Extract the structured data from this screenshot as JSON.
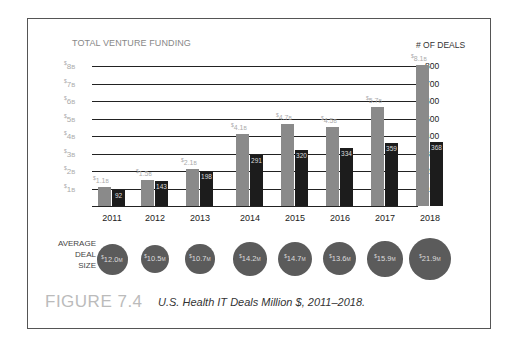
{
  "chart_data": {
    "type": "bar",
    "title": "U.S. Health IT Deals Million $, 2011–2018.",
    "figure_label": "FIGURE 7.4",
    "left_axis_title": "TOTAL VENTURE FUNDING",
    "right_axis_title": "# OF DEALS",
    "categories": [
      "2011",
      "2012",
      "2013",
      "2014",
      "2015",
      "2016",
      "2017",
      "2018"
    ],
    "series": [
      {
        "name": "Total Venture Funding ($B)",
        "axis": "left",
        "values": [
          1.1,
          1.5,
          2.1,
          4.1,
          4.7,
          4.5,
          5.7,
          8.1
        ],
        "labels": [
          "$1.1B",
          "$1.5B",
          "$2.1B",
          "$4.1B",
          "$4.7B",
          "$4.5B",
          "$5.7B",
          "$8.1B"
        ],
        "color": "#8a8a8a"
      },
      {
        "name": "# of Deals",
        "axis": "right",
        "values": [
          92,
          143,
          198,
          291,
          320,
          334,
          359,
          368
        ],
        "color": "#1c1c1c"
      },
      {
        "name": "Average Deal Size ($M)",
        "type": "bubble",
        "values": [
          12.0,
          10.5,
          10.7,
          14.2,
          14.7,
          13.6,
          15.9,
          21.9
        ],
        "labels": [
          "$12.0M",
          "$10.5M",
          "$10.7M",
          "$14.2M",
          "$14.7M",
          "$13.6M",
          "$15.9M",
          "$21.9M"
        ],
        "color": "#5b5b5b"
      }
    ],
    "left_ticks": [
      "$1B",
      "$2B",
      "$3B",
      "$4B",
      "$5B",
      "$6B",
      "$7B",
      "$8B"
    ],
    "right_ticks": [
      "100",
      "200",
      "300",
      "400",
      "500",
      "600",
      "700",
      "800"
    ],
    "ylim_left": [
      0,
      8
    ],
    "ylim_right": [
      0,
      800
    ],
    "grid": true,
    "bubble_row_label": "AVERAGE DEAL SIZE"
  },
  "text": {
    "left_title": "TOTAL VENTURE FUNDING",
    "right_title": "# OF DEALS",
    "avg_line1": "AVERAGE",
    "avg_line2": "DEAL",
    "avg_line3": "SIZE",
    "figure_label": "FIGURE 7.4",
    "caption": "U.S. Health IT Deals Million $, 2011–2018."
  }
}
